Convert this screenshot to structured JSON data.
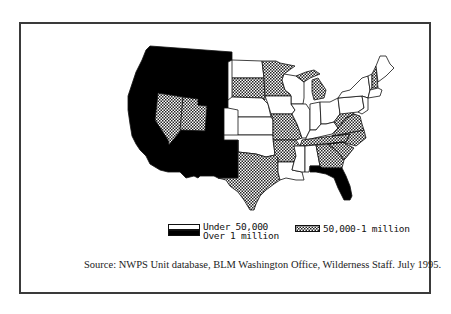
{
  "map": {
    "title": "",
    "type": "choropleth",
    "region": "Contiguous United States",
    "colors": {
      "under_50000": "#ffffff",
      "50000_to_1_million": "crosshatch",
      "over_1_million": "#000000",
      "outline": "#111111"
    },
    "categories": {
      "over_1_million": [
        "WA",
        "OR",
        "CA",
        "ID",
        "MT",
        "WY",
        "CO",
        "AZ",
        "NM",
        "FL"
      ],
      "50000_to_1_million": [
        "NV",
        "UT",
        "SD",
        "MN",
        "MI",
        "MO",
        "TX",
        "AR",
        "TN",
        "GA",
        "SC",
        "NC",
        "VA",
        "WV",
        "NH"
      ],
      "under_50000": [
        "ND",
        "NE",
        "KS",
        "OK",
        "IA",
        "WI",
        "IL",
        "IN",
        "OH",
        "KY",
        "LA",
        "MS",
        "AL",
        "PA",
        "NY",
        "VT",
        "ME",
        "MA",
        "CT",
        "RI",
        "NJ",
        "DE",
        "MD"
      ]
    }
  },
  "legend": {
    "items": [
      {
        "label": "Under 50,000",
        "swatch": "white"
      },
      {
        "label": "Over 1 million",
        "swatch": "black"
      },
      {
        "label": "50,000-1 million",
        "swatch": "crosshatch"
      }
    ]
  },
  "source": "Source: NWPS Unit database, BLM Washington Office, Wilderness Staff.  July 1995."
}
